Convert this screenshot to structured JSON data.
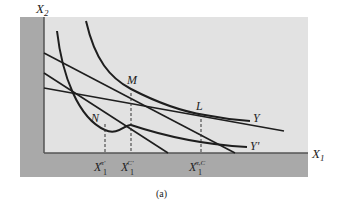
{
  "figure": {
    "caption": "(a)",
    "axes": {
      "y_label": "X",
      "y_label_sub": "2",
      "x_label": "X",
      "x_label_sub": "1"
    },
    "points": [
      {
        "id": "M",
        "label": "M"
      },
      {
        "id": "N",
        "label": "N"
      },
      {
        "id": "L",
        "label": "L"
      }
    ],
    "curves": [
      {
        "id": "indifference-curve-Y",
        "label": "Y"
      },
      {
        "id": "indifference-curve-Y-prime",
        "label": "Y'"
      }
    ],
    "budget_lines": [
      {
        "id": "budget-line-steep"
      },
      {
        "id": "budget-line-medium"
      },
      {
        "id": "budget-line-flat"
      }
    ],
    "tick_labels": [
      {
        "id": "x1-pi-prime",
        "base": "X",
        "sub": "1",
        "sup": "π'"
      },
      {
        "id": "x1-c-prime",
        "base": "X",
        "sub": "1",
        "sup": "C'"
      },
      {
        "id": "x1-pi-c",
        "base": "X",
        "sub": "1",
        "sup": "π,C"
      }
    ],
    "colors": {
      "plot_background": "#e2e2e2",
      "axis_band": "#a9a9a9",
      "curve": "#1e1e1e",
      "dashed": "#333333",
      "text": "#222222"
    }
  }
}
